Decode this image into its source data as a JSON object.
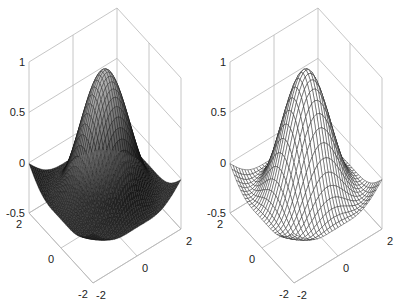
{
  "chart_data": [
    {
      "type": "surface",
      "style": "filled-shaded-mesh",
      "title": "",
      "xlabel": "",
      "ylabel": "",
      "zlabel": "",
      "function": "z = sin(r)/r-like radial ripple (peak 1 at center, trough ~-0.5)",
      "x_range": [
        -2,
        2
      ],
      "y_range": [
        -2,
        2
      ],
      "zlim": [
        -0.5,
        1
      ],
      "x_ticks": [
        "-2",
        "0",
        "2"
      ],
      "y_ticks": [
        "-2",
        "0",
        "2"
      ],
      "z_ticks": [
        "-0.5",
        "0",
        "0.5",
        "1"
      ],
      "grid": true,
      "colormap": "gray"
    },
    {
      "type": "surface",
      "style": "wireframe-mesh",
      "title": "",
      "xlabel": "",
      "ylabel": "",
      "zlabel": "",
      "function": "z = sin(r)/r-like radial ripple (peak 1 at center, trough ~-0.5)",
      "x_range": [
        -2,
        2
      ],
      "y_range": [
        -2,
        2
      ],
      "zlim": [
        -0.5,
        1
      ],
      "x_ticks": [
        "-2",
        "0",
        "2"
      ],
      "y_ticks": [
        "-2",
        "0",
        "2"
      ],
      "z_ticks": [
        "-0.5",
        "0",
        "0.5",
        "1"
      ],
      "grid": true,
      "colormap": "black-lines"
    }
  ],
  "plots": [
    {
      "z_ticks": [
        "1",
        "0.5",
        "0",
        "-0.5"
      ],
      "y_ticks": [
        "2",
        "0",
        "-2"
      ],
      "x_ticks": [
        "-2",
        "0",
        "2"
      ]
    },
    {
      "z_ticks": [
        "1",
        "0.5",
        "0",
        "-0.5"
      ],
      "y_ticks": [
        "2",
        "0",
        "-2"
      ],
      "x_ticks": [
        "-2",
        "0",
        "2"
      ]
    }
  ]
}
